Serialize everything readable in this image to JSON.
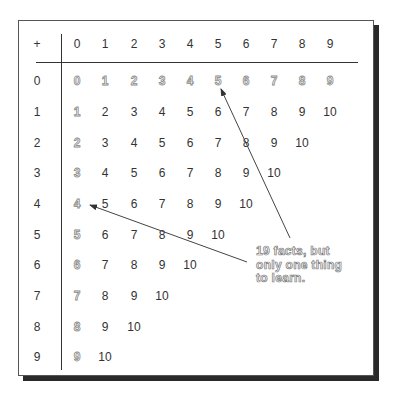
{
  "table": {
    "operator": "+",
    "column_headers": [
      "0",
      "1",
      "2",
      "3",
      "4",
      "5",
      "6",
      "7",
      "8",
      "9"
    ],
    "row_headers": [
      "0",
      "1",
      "2",
      "3",
      "4",
      "5",
      "6",
      "7",
      "8",
      "9"
    ],
    "rows": [
      [
        "0",
        "1",
        "2",
        "3",
        "4",
        "5",
        "6",
        "7",
        "8",
        "9"
      ],
      [
        "1",
        "2",
        "3",
        "4",
        "5",
        "6",
        "7",
        "8",
        "9",
        "10"
      ],
      [
        "2",
        "3",
        "4",
        "5",
        "6",
        "7",
        "8",
        "9",
        "10"
      ],
      [
        "3",
        "4",
        "5",
        "6",
        "7",
        "8",
        "9",
        "10"
      ],
      [
        "4",
        "5",
        "6",
        "7",
        "8",
        "9",
        "10"
      ],
      [
        "5",
        "6",
        "7",
        "8",
        "9",
        "10"
      ],
      [
        "6",
        "7",
        "8",
        "9",
        "10"
      ],
      [
        "7",
        "8",
        "9",
        "10"
      ],
      [
        "8",
        "9",
        "10"
      ],
      [
        "9",
        "10"
      ]
    ],
    "highlight_note": "Row 0 and column 0 (adding zero) are shown in outlined gray"
  },
  "annotation": {
    "lines": [
      "19 facts, but",
      "only one thing",
      "to learn."
    ]
  },
  "colors": {
    "line": "#333333",
    "shadow": "#2a2a2a",
    "ghost_outline": "#888888"
  }
}
